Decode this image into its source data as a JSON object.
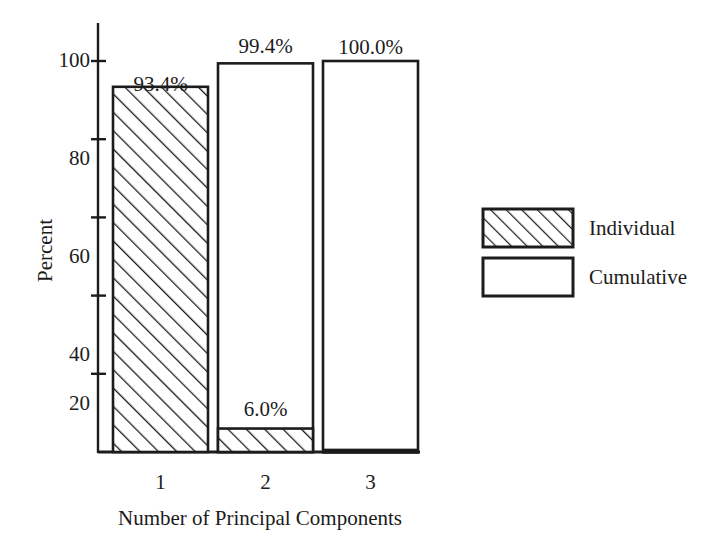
{
  "chart_data": {
    "type": "bar",
    "title": "",
    "subtitle": "",
    "xlabel": "Number of Principal Components",
    "ylabel": "Percent",
    "categories": [
      "1",
      "2",
      "3"
    ],
    "series": [
      {
        "name": "Individual",
        "style": "hatched",
        "values": [
          93.4,
          6.0,
          0.6
        ],
        "labels": [
          "93.4%",
          "6.0%",
          ""
        ]
      },
      {
        "name": "Cumulative",
        "style": "outline",
        "values": [
          93.4,
          99.4,
          100.0
        ],
        "labels": [
          "",
          "99.4%",
          "100.0%"
        ]
      }
    ],
    "value_labels": [
      {
        "text": "93.4%",
        "category": "1",
        "series": "Individual",
        "value": 93.4
      },
      {
        "text": "99.4%",
        "category": "2",
        "series": "Cumulative",
        "value": 99.4
      },
      {
        "text": "6.0%",
        "category": "2",
        "series": "Individual",
        "value": 6.0
      },
      {
        "text": "100.0%",
        "category": "3",
        "series": "Cumulative",
        "value": 100.0
      }
    ],
    "ylim": [
      0,
      108
    ],
    "yticks": [
      20,
      40,
      60,
      80,
      100
    ],
    "ytick_labels": [
      "20",
      "40",
      "60",
      "80",
      "100"
    ],
    "grid": false,
    "legend_position": "right",
    "legend_entries": [
      {
        "label": "Individual",
        "style": "hatched"
      },
      {
        "label": "Cumulative",
        "style": "outline"
      }
    ],
    "colors": {
      "axis": "#1c1c1c",
      "bar_edge": "#1c1c1c",
      "bar_fill": "#ffffff",
      "hatch": "#1c1c1c",
      "background": "#ffffff",
      "text": "#1c1c1c"
    }
  },
  "axes": {
    "y_title": "Percent",
    "x_title": "Number of Principal Components",
    "y_ticks": [
      "100",
      "80",
      "60",
      "40",
      "20"
    ],
    "x_ticks": [
      "1",
      "2",
      "3"
    ]
  },
  "labels": {
    "bar1_individual": "93.4%",
    "bar2_cumulative": "99.4%",
    "bar2_individual": "6.0%",
    "bar3_cumulative": "100.0%"
  },
  "legend": {
    "individual": "Individual",
    "cumulative": "Cumulative"
  }
}
